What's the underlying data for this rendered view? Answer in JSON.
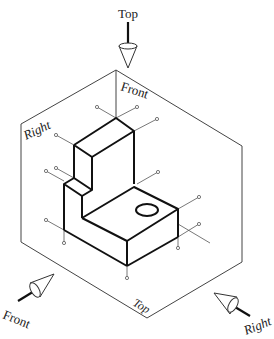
{
  "diagram": {
    "type": "glass-box-projection",
    "labels": {
      "top_arrow": "Top",
      "front_arrow": "Front",
      "right_arrow": "Right",
      "back_plane": "Front",
      "left_plane": "Right",
      "bottom_plane": "Top"
    },
    "colors": {
      "object_edges": "#111111",
      "box_edges": "#444444",
      "projectors": "#555555",
      "background": "#ffffff"
    }
  }
}
